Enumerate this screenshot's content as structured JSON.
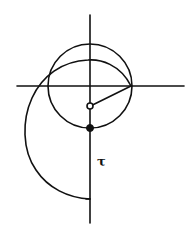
{
  "figure": {
    "width": 196,
    "height": 226,
    "background": "#ffffff",
    "stroke_color": "#111111",
    "labels": {
      "tau": "τ"
    },
    "elements": {
      "horizontal_axis": {
        "x1": 17,
        "y": 86,
        "x2": 184
      },
      "vertical_axis": {
        "x": 90,
        "y1": 15,
        "y2": 223
      },
      "circle": {
        "cx": 90,
        "cy": 86,
        "r": 42
      },
      "radius_segment": {
        "from": [
          90,
          106
        ],
        "to": [
          131,
          86
        ]
      },
      "hollow_point": {
        "cx": 90,
        "cy": 106,
        "r": 3
      },
      "filled_point": {
        "cx": 90,
        "cy": 128,
        "r": 3.5
      },
      "outer_curve_end": [
        90,
        199
      ]
    }
  }
}
